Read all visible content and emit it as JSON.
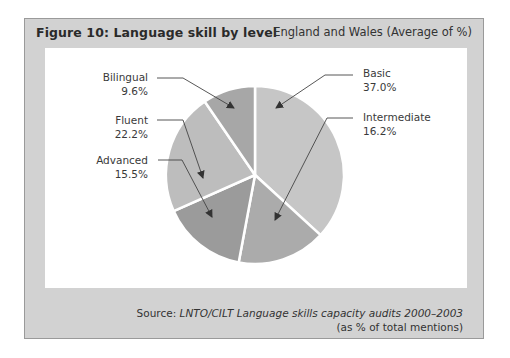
{
  "figure": {
    "title": "Figure 10: Language skill by level",
    "subtitle": "England and Wales (Average of %)",
    "source_prefix": "Source: ",
    "source_italic": "LNTO/CILT Language skills capacity audits 2000–2003",
    "source_note": "(as % of total mentions)"
  },
  "labels": {
    "basic": {
      "name": "Basic",
      "value": "37.0%"
    },
    "intermediate": {
      "name": "Intermediate",
      "value": "16.2%"
    },
    "advanced": {
      "name": "Advanced",
      "value": "15.5%"
    },
    "fluent": {
      "name": "Fluent",
      "value": "22.2%"
    },
    "bilingual": {
      "name": "Bilingual",
      "value": "9.6%"
    }
  },
  "colors": {
    "frame": "#d2d2d2",
    "basic": "#c6c6c6",
    "intermediate": "#ababab",
    "advanced": "#9b9b9b",
    "fluent": "#bdbdbd",
    "bilingual": "#a7a7a7"
  },
  "chart_data": {
    "type": "pie",
    "title": "Figure 10: Language skill by level",
    "subtitle": "England and Wales (Average of %)",
    "categories": [
      "Basic",
      "Intermediate",
      "Advanced",
      "Fluent",
      "Bilingual"
    ],
    "values": [
      37.0,
      16.2,
      15.5,
      22.2,
      9.6
    ],
    "unit": "%",
    "start_angle": "12 o'clock",
    "direction": "clockwise",
    "legend": "none (callout labels with arrows)",
    "source": "Source: LNTO/CILT Language skills capacity audits 2000–2003 (as % of total mentions)"
  }
}
